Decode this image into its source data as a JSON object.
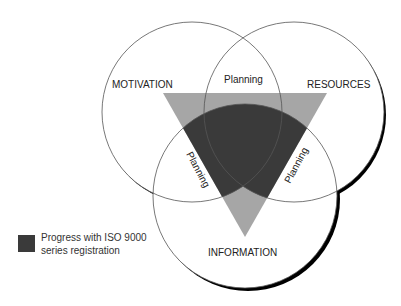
{
  "diagram": {
    "type": "venn",
    "circles": [
      {
        "label": "MOTIVATION",
        "cx": 192,
        "cy": 112,
        "r": 90
      },
      {
        "label": "RESOURCES",
        "cx": 294,
        "cy": 112,
        "r": 90
      },
      {
        "label": "INFORMATION",
        "cx": 245,
        "cy": 196,
        "r": 92
      }
    ],
    "intersections": {
      "top": "Planning",
      "left": "Planning",
      "right": "Planning"
    },
    "triangle": {
      "points": "163,93 327,93 245,237"
    },
    "colors": {
      "triangle": "#a6a6a6",
      "progress": "#3a3a3a",
      "outline": "#555555",
      "shadow": "#000000"
    }
  },
  "legend": {
    "label_line1": "Progress with ISO 9000",
    "label_line2": "series registration"
  }
}
